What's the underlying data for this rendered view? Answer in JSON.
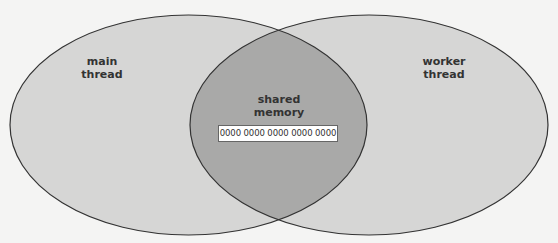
{
  "diagram": {
    "type": "venn",
    "sets": [
      {
        "id": "main-thread",
        "label_lines": [
          "main",
          "thread"
        ],
        "fill": "#d6d6d5",
        "stroke": "#333333"
      },
      {
        "id": "worker-thread",
        "label_lines": [
          "worker",
          "thread"
        ],
        "fill": "#d6d6d5",
        "stroke": "#333333"
      }
    ],
    "intersection": {
      "label_lines": [
        "shared",
        "memory"
      ],
      "fill": "#a9a9a8",
      "memory_value": "0000 0000 0000 0000 0000"
    }
  }
}
